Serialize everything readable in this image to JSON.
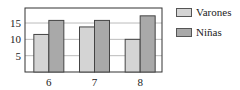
{
  "chart_data": {
    "type": "bar",
    "title": "",
    "xlabel": "",
    "ylabel": "",
    "categories": [
      "6",
      "7",
      "8"
    ],
    "series": [
      {
        "name": "Varones",
        "values": [
          11.5,
          13.8,
          10
        ],
        "color": "#d4d4d4"
      },
      {
        "name": "Niñas",
        "values": [
          15.8,
          15.8,
          17.2
        ],
        "color": "#a9a9a9"
      }
    ],
    "yticks": [
      5,
      10,
      15
    ],
    "ylim": [
      0,
      19.6
    ],
    "grid": true,
    "legend_position": "right"
  }
}
